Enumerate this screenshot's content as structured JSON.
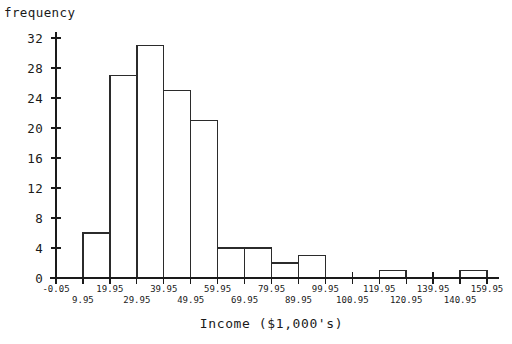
{
  "top_clipped_caption": "                                                                                        ",
  "axes": {
    "y_title": "frequency",
    "x_title": "Income ($1,000's)"
  },
  "chart_data": {
    "type": "bar",
    "title": "",
    "subtitle": "",
    "xlabel": "Income ($1,000's)",
    "ylabel": "frequency",
    "grid": false,
    "legend": "none",
    "ylim": [
      0,
      33
    ],
    "y_ticks": [
      0,
      4,
      8,
      12,
      16,
      20,
      24,
      28,
      32
    ],
    "y_tick_labels": [
      "0",
      "4",
      "8",
      "12",
      "16",
      "20",
      "24",
      "28",
      "32"
    ],
    "x_tick_labels_upper_row": [
      "-0.05",
      "19.95",
      "39.95",
      "59.95",
      "79.95",
      "99.95",
      "119.95",
      "139.95",
      "159.95"
    ],
    "x_tick_labels_lower_row": [
      "9.95",
      "29.95",
      "49.95",
      "69.95",
      "89.95",
      "100.95",
      "120.95",
      "140.95"
    ],
    "x_tick_labels_all": [
      "-0.05",
      "9.95",
      "19.95",
      "29.95",
      "39.95",
      "49.95",
      "59.95",
      "69.95",
      "79.95",
      "89.95",
      "99.95",
      "100.95",
      "119.95",
      "120.95",
      "139.95",
      "140.95",
      "159.95"
    ],
    "bin_edges": [
      -0.05,
      9.95,
      19.95,
      29.95,
      39.95,
      49.95,
      59.95,
      69.95,
      79.95,
      89.95,
      99.95,
      100.95,
      119.95,
      120.95,
      139.95,
      140.95,
      159.95
    ],
    "categories": [
      "-0.05–09.95",
      "9.95–19.95",
      "19.95–29.95",
      "29.95–39.95",
      "39.95–49.95",
      "49.95–59.95",
      "59.95–69.95",
      "69.95–79.95",
      "79.95–89.95",
      "89.95–99.95",
      "99.95–100.95",
      "100.95–119.95",
      "119.95–120.95",
      "120.95–139.95",
      "139.95–140.95",
      "140.95–159.95"
    ],
    "values": [
      0,
      6,
      27,
      31,
      25,
      21,
      4,
      4,
      2,
      3,
      0,
      0,
      1,
      0,
      0,
      1
    ]
  },
  "colors": {
    "ink": "#1a1a1a",
    "bar_stroke": "#2b2b2b",
    "bar_fill": "#ffffff",
    "background": "#ffffff"
  }
}
